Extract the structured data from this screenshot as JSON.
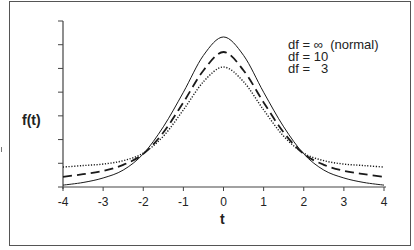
{
  "chart_data": {
    "type": "line",
    "title": "",
    "xlabel": "t",
    "ylabel": "f(t)",
    "xlim": [
      -4,
      4
    ],
    "ylim": [
      0,
      0.42
    ],
    "grid": false,
    "legend_position": "upper right (inside)",
    "x_ticks": [
      "-4",
      "-3",
      "-2",
      "-1",
      "0",
      "1",
      "2",
      "3",
      "4"
    ],
    "y_ticks_count": 8,
    "y_tick_labels": [],
    "x": [
      -4,
      -3.5,
      -3,
      -2.5,
      -2,
      -1.5,
      -1,
      -0.5,
      0,
      0.5,
      1,
      1.5,
      2,
      2.5,
      3,
      3.5,
      4
    ],
    "series": [
      {
        "name": "df = ∞  (normal)",
        "style": "solid",
        "values": [
          0.005,
          0.012,
          0.024,
          0.045,
          0.088,
          0.16,
          0.252,
          0.35,
          0.399,
          0.35,
          0.252,
          0.16,
          0.088,
          0.045,
          0.024,
          0.012,
          0.005
        ]
      },
      {
        "name": "df = 10",
        "style": "dashed",
        "values": [
          0.027,
          0.034,
          0.043,
          0.059,
          0.088,
          0.145,
          0.225,
          0.31,
          0.359,
          0.31,
          0.225,
          0.145,
          0.088,
          0.059,
          0.043,
          0.034,
          0.027
        ]
      },
      {
        "name": "df =   3",
        "style": "dotted",
        "values": [
          0.053,
          0.057,
          0.061,
          0.07,
          0.09,
          0.135,
          0.205,
          0.28,
          0.319,
          0.28,
          0.205,
          0.135,
          0.09,
          0.07,
          0.061,
          0.057,
          0.053
        ]
      }
    ]
  },
  "legend": {
    "items": [
      {
        "label": "df = ∞  (normal)"
      },
      {
        "label": "df = 10"
      },
      {
        "label": "df =   3"
      }
    ]
  },
  "axes": {
    "x_title": "t",
    "y_title": "f(t)",
    "x_tick_labels": [
      "-4",
      "-3",
      "-2",
      "-1",
      "0",
      "1",
      "2",
      "3",
      "4"
    ]
  },
  "colors": {
    "line": "#1a1a1a",
    "axis": "#444444",
    "frame": "#555555"
  }
}
